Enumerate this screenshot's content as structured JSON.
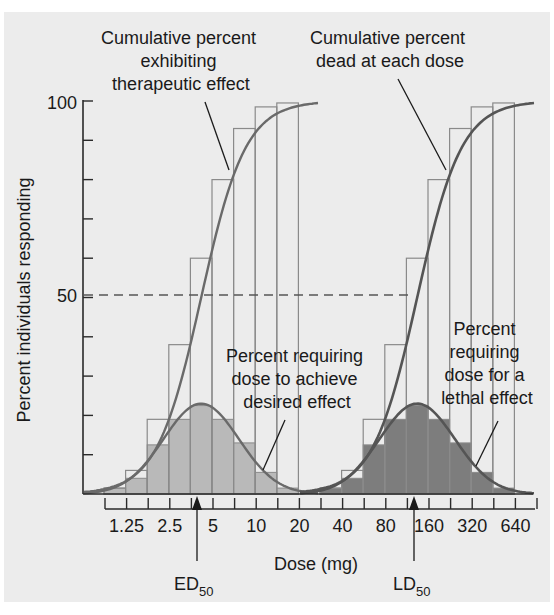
{
  "chart_data": {
    "type": "bar",
    "title": "",
    "xlabel": "Dose (mg)",
    "ylabel": "Percent individuals responding",
    "ylim": [
      0,
      100
    ],
    "y_ticks": [
      "100",
      "50"
    ],
    "x_scale": "log2",
    "x_tick_labels": [
      "1.25",
      "2.5",
      "5",
      "10",
      "20",
      "40",
      "80",
      "160",
      "320",
      "640"
    ],
    "markers": [
      {
        "label": "ED",
        "subscript": "50",
        "approx_dose_mg": 4.2
      },
      {
        "label": "LD",
        "subscript": "50",
        "approx_dose_mg": 140
      }
    ],
    "reference_line": {
      "y": 50,
      "style": "dashed"
    },
    "series": [
      {
        "name": "Percent requiring dose to achieve desired effect",
        "kind": "histogram",
        "fill": "#b9b9b9",
        "bin_values": [
          1.5,
          4,
          12.5,
          19,
          22.5,
          19,
          13,
          5.5,
          1.5
        ]
      },
      {
        "name": "Cumulative percent exhibiting therapeutic effect",
        "kind": "cumulative-step + sigmoid",
        "values": [
          1.5,
          6,
          19,
          38,
          60,
          80,
          93,
          98.5,
          99.5
        ]
      },
      {
        "name": "Percent requiring dose for a lethal effect",
        "kind": "histogram",
        "fill": "#7d7d7d",
        "bin_values": [
          1.5,
          4,
          12.5,
          19,
          22.5,
          19,
          13,
          5.5,
          1.5
        ]
      },
      {
        "name": "Cumulative percent dead at each dose",
        "kind": "cumulative-step + sigmoid",
        "values": [
          1.5,
          6,
          19,
          38,
          60,
          80,
          93,
          98.5,
          99.5
        ]
      }
    ],
    "annotations": [
      "Cumulative percent exhibiting therapeutic effect",
      "Cumulative percent dead at each dose",
      "Percent requiring dose to achieve desired effect",
      "Percent requiring dose for a lethal effect"
    ],
    "grid": false,
    "legend": "none (inline annotations)"
  },
  "labels": {
    "ann_cum_ther": [
      "Cumulative percent",
      "exhibiting",
      "therapeutic effect"
    ],
    "ann_cum_dead": [
      "Cumulative percent",
      "dead at each dose"
    ],
    "ann_pct_desired": [
      "Percent requiring",
      "dose to achieve",
      "desired effect"
    ],
    "ann_pct_lethal": [
      "Percent",
      "requiring",
      "dose for a",
      "lethal effect"
    ],
    "ytick_100": "100",
    "ytick_50": "50",
    "ylabel": "Percent individuals responding",
    "xlabel": "Dose (mg)",
    "x_ticks": [
      "1.25",
      "2.5",
      "5",
      "10",
      "20",
      "40",
      "80",
      "160",
      "320",
      "640"
    ],
    "ed": "ED",
    "ld": "LD",
    "sub50": "50"
  },
  "colors": {
    "background": "#ececec",
    "curve": "#6a6a6a",
    "step_outline": "#8a8a8a",
    "hist_light": "#b9b9b9",
    "hist_dark": "#7d7d7d",
    "axis": "#2a2a2a"
  }
}
